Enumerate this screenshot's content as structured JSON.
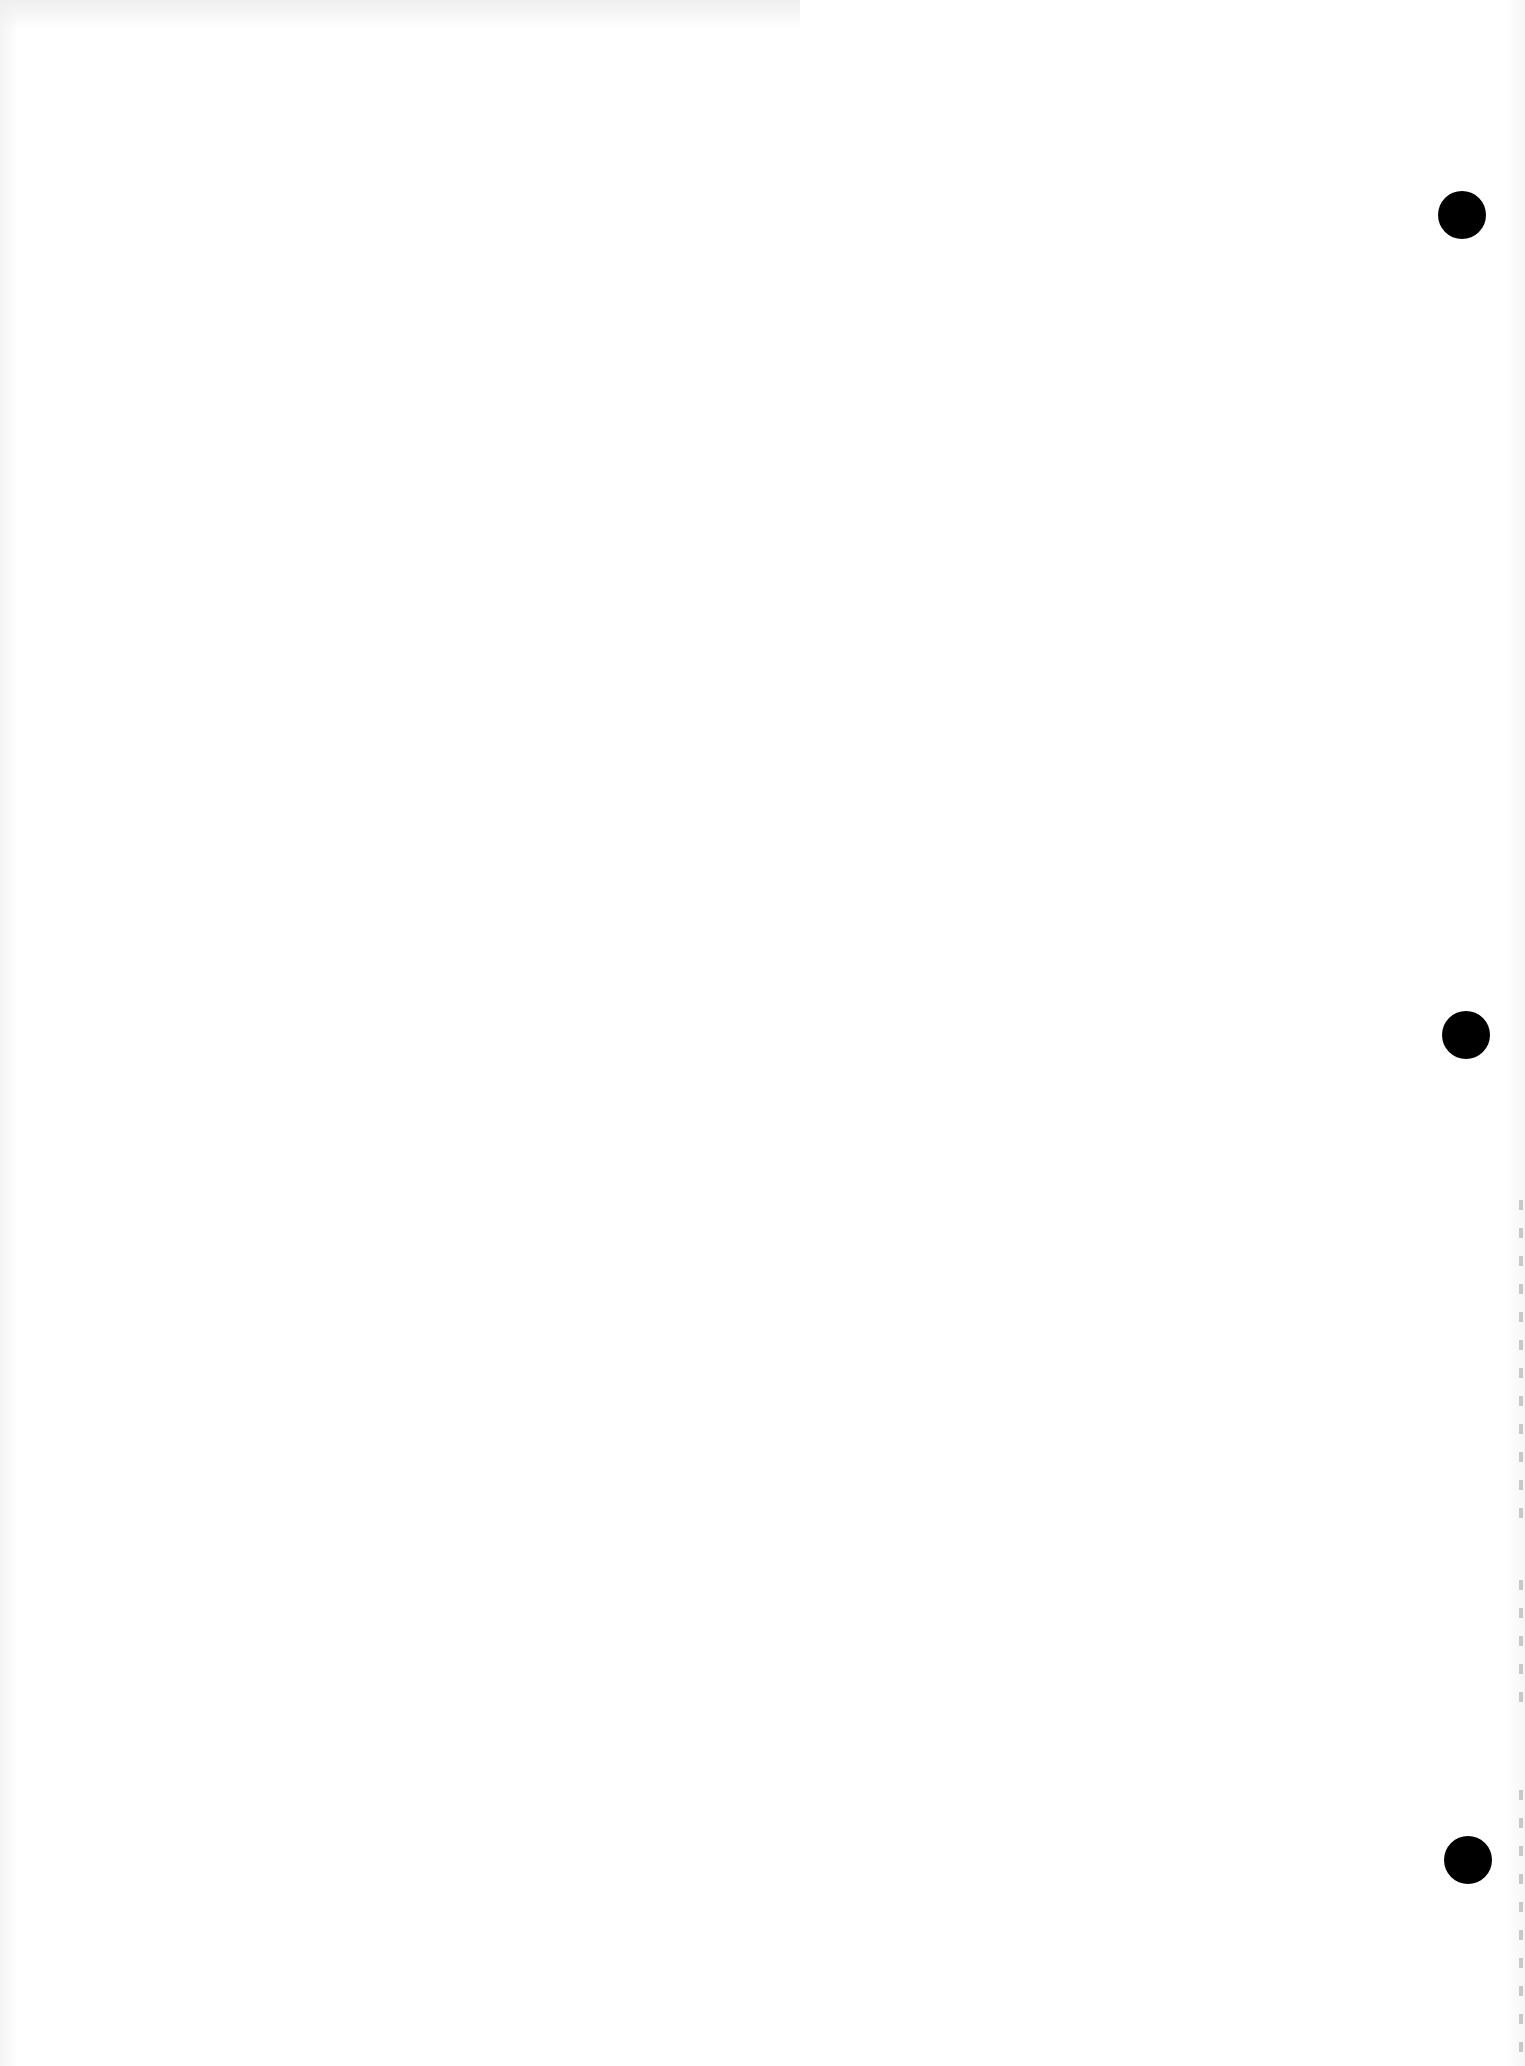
{
  "document": {
    "type": "scanned blank page",
    "background_color": "#ffffff",
    "text": ""
  },
  "punch_holes": [
    {
      "x": 1462,
      "y": 215,
      "radius": 24,
      "color": "#000000"
    },
    {
      "x": 1466,
      "y": 1035,
      "radius": 24,
      "color": "#000000"
    },
    {
      "x": 1468,
      "y": 1860,
      "radius": 24,
      "color": "#000000"
    }
  ],
  "edge_marks": [
    {
      "top": 1200,
      "height": 330
    },
    {
      "top": 1580,
      "height": 140
    },
    {
      "top": 1790,
      "height": 270
    }
  ]
}
